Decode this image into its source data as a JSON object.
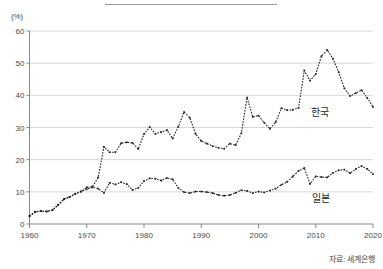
{
  "figure": {
    "unit_label": "(%)",
    "source_note": "자료: 세계은행",
    "has_title_rule": true
  },
  "labels": {
    "korea": "한국",
    "japan": "일본"
  },
  "colors": {
    "series": "#222222",
    "grid": "#d8d8d8",
    "axis": "#888888",
    "text": "#4a4a4a"
  },
  "chart_data": {
    "type": "line",
    "title": "",
    "subtitle": "",
    "xlabel": "",
    "ylabel": "(%)",
    "xlim": [
      1960,
      2020
    ],
    "ylim": [
      0,
      60
    ],
    "yticks": [
      0,
      10,
      20,
      30,
      40,
      50,
      60
    ],
    "xticks": [
      1960,
      1970,
      1980,
      1990,
      2000,
      2010,
      2020
    ],
    "grid": true,
    "legend": "inline-annotation",
    "marker": "dotted-square",
    "x": [
      1960,
      1961,
      1962,
      1963,
      1964,
      1965,
      1966,
      1967,
      1968,
      1969,
      1970,
      1971,
      1972,
      1973,
      1974,
      1975,
      1976,
      1977,
      1978,
      1979,
      1980,
      1981,
      1982,
      1983,
      1984,
      1985,
      1986,
      1987,
      1988,
      1989,
      1990,
      1991,
      1992,
      1993,
      1994,
      1995,
      1996,
      1997,
      1998,
      1999,
      2000,
      2001,
      2002,
      2003,
      2004,
      2005,
      2006,
      2007,
      2008,
      2009,
      2010,
      2011,
      2012,
      2013,
      2014,
      2015,
      2016,
      2017,
      2018,
      2019,
      2020
    ],
    "series": [
      {
        "name": "한국",
        "values": [
          2.4,
          3.8,
          4.0,
          3.9,
          4.3,
          5.9,
          7.7,
          8.4,
          9.4,
          10.1,
          11.4,
          11.6,
          14.5,
          24.0,
          22.3,
          22.3,
          25.1,
          25.4,
          25.2,
          23.3,
          28.0,
          30.1,
          28.0,
          28.6,
          29.2,
          26.6,
          30.3,
          34.8,
          33.0,
          28.0,
          25.8,
          25.0,
          24.2,
          23.7,
          23.4,
          25.0,
          24.5,
          28.2,
          39.3,
          33.3,
          33.7,
          31.5,
          29.6,
          31.7,
          36.0,
          35.4,
          35.5,
          36.1,
          47.7,
          44.6,
          46.6,
          52.2,
          54.1,
          51.4,
          47.2,
          42.2,
          39.8,
          40.7,
          41.6,
          39.2,
          36.4
        ]
      },
      {
        "name": "일본",
        "values": [
          2.5,
          3.8,
          4.0,
          3.9,
          4.3,
          5.9,
          7.7,
          8.4,
          9.4,
          10.1,
          10.8,
          11.4,
          11.0,
          9.7,
          12.8,
          12.3,
          13.0,
          12.4,
          10.6,
          11.2,
          13.3,
          14.2,
          14.1,
          13.5,
          14.3,
          13.9,
          11.2,
          9.9,
          9.6,
          10.1,
          10.1,
          9.9,
          9.6,
          9.0,
          8.8,
          9.0,
          9.7,
          10.5,
          10.3,
          9.6,
          10.1,
          9.8,
          10.4,
          11.0,
          12.2,
          13.1,
          14.8,
          16.5,
          17.4,
          12.5,
          14.8,
          14.6,
          14.5,
          15.9,
          16.7,
          16.9,
          15.8,
          17.1,
          18.0,
          17.1,
          15.5
        ]
      }
    ]
  }
}
